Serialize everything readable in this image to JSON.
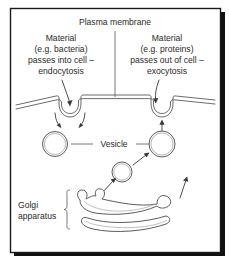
{
  "figure": {
    "background_color": "#ffffff",
    "frame_color": "#1a1a1a",
    "ink_color": "#3a3a3a"
  },
  "labels": {
    "plasma_membrane": "Plasma membrane",
    "endocytosis": {
      "line1": "Material",
      "line2": "(e.g. bacteria)",
      "line3": "passes into cell –",
      "line4": "endocytosis"
    },
    "exocytosis": {
      "line1": "Material",
      "line2": "(e.g. proteins)",
      "line3": "passes out of cell –",
      "line4": "exocytosis"
    },
    "vesicle": "Vesicle",
    "golgi": {
      "line1": "Golgi",
      "line2": "apparatus"
    }
  },
  "structures": {
    "plasma_membrane_icon": "membrane-bilayer-line",
    "endocytosis_pit_icon": "membrane-invagination",
    "exocytosis_pit_icon": "membrane-invagination",
    "vesicle_icon": "circle-outline",
    "golgi_icon": "stacked-cisternae",
    "bracket_icon": "curly-bracket-left"
  }
}
